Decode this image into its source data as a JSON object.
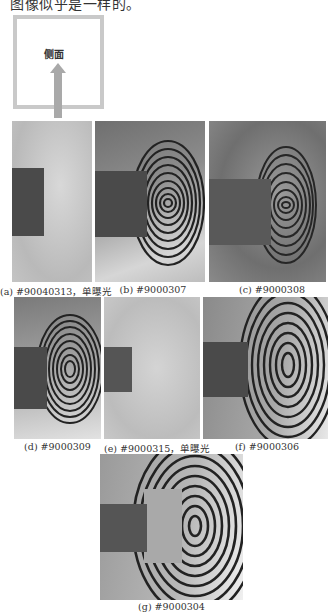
{
  "top_text": "图像似乎是一样的。",
  "diagram": {
    "label": "侧面",
    "arrow": "up-arrow"
  },
  "figures": [
    {
      "id": "a",
      "caption": "(a) #90040313，单曝光",
      "fringes": false
    },
    {
      "id": "b",
      "caption": "(b) #9000307",
      "fringes": true
    },
    {
      "id": "c",
      "caption": "(c) #9000308",
      "fringes": true
    },
    {
      "id": "d",
      "caption": "(d) #9000309",
      "fringes": true
    },
    {
      "id": "e",
      "caption": "(e) #9000315，单曝光",
      "fringes": false
    },
    {
      "id": "f",
      "caption": "(f) #9000306",
      "fringes": true
    },
    {
      "id": "g",
      "caption": "(g) #9000304",
      "fringes": true
    }
  ]
}
